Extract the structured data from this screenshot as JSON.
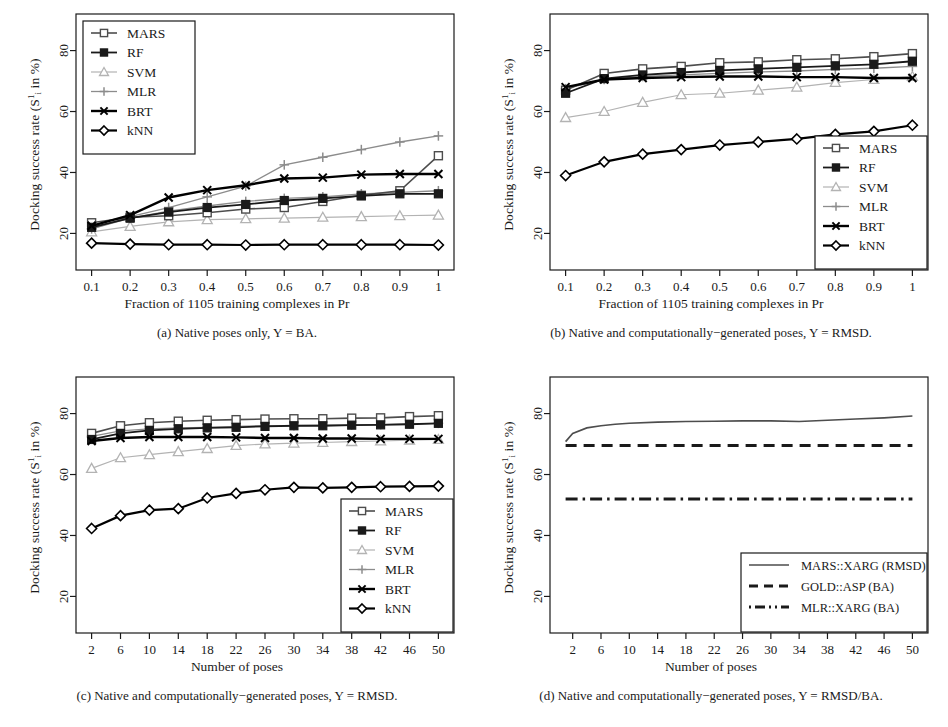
{
  "figure": {
    "y_axis_label_prefix": "Docking success rate (S",
    "y_axis_label_sub": "i",
    "y_axis_label_sup": "1",
    "y_axis_label_suffix": " in %)",
    "y_ticks": [
      20,
      40,
      60,
      80
    ],
    "y_lim": [
      8,
      92
    ]
  },
  "panels": [
    {
      "id": "a",
      "caption": "(a) Native poses only, Y = BA.",
      "xlabel": "Fraction of 1105 training complexes in Pr",
      "legend_position": "top-left"
    },
    {
      "id": "b",
      "caption": "(b) Native and computationally−generated poses, Y = RMSD.",
      "xlabel": "Fraction of 1105 training complexes in Pr",
      "legend_position": "bottom-right"
    },
    {
      "id": "c",
      "caption": "(c) Native and computationally−generated poses, Y = RMSD.",
      "xlabel": "Number of poses",
      "legend_position": "bottom-right"
    },
    {
      "id": "d",
      "caption": "(d) Native and computationally−generated poses, Y = RMSD/BA.",
      "xlabel": "Number of poses",
      "legend_position": "bottom-right"
    }
  ],
  "colors": {
    "MARS": "#4d4d4d",
    "RF": "#1a1a1a",
    "SVM": "#b3b3b3",
    "MLR": "#8c8c8c",
    "BRT": "#000000",
    "kNN": "#000000",
    "MARS_XARG": "#4d4d4d",
    "GOLD_ASP": "#1a1a1a",
    "MLR_XARG": "#1a1a1a"
  },
  "markers": {
    "MARS": "open-square",
    "RF": "filled-square",
    "SVM": "open-triangle",
    "MLR": "plus",
    "BRT": "cross-x",
    "kNN": "open-diamond"
  },
  "chart_data": [
    {
      "panel": "a",
      "type": "line",
      "title": "(a) Native poses only, Y = BA.",
      "xlabel": "Fraction of 1105 training complexes in Pr",
      "ylabel": "Docking success rate (S_i^1 in %)",
      "x": [
        0.1,
        0.2,
        0.3,
        0.4,
        0.5,
        0.6,
        0.7,
        0.8,
        0.9,
        1
      ],
      "xtick_labels": [
        "0.1",
        "0.2",
        "0.3",
        "0.4",
        "0.5",
        "0.6",
        "0.7",
        "0.8",
        "0.9",
        "1"
      ],
      "ylim": [
        8,
        92
      ],
      "ytick_labels": [
        "20",
        "40",
        "60",
        "80"
      ],
      "grid": false,
      "legend": [
        "MARS",
        "RF",
        "SVM",
        "MLR",
        "BRT",
        "kNN"
      ],
      "legend_position": "top-left",
      "series": [
        {
          "name": "MARS",
          "values": [
            23.5,
            25.3,
            25.8,
            26.8,
            28.0,
            28.5,
            30.5,
            32.5,
            34.0,
            45.5
          ]
        },
        {
          "name": "RF",
          "values": [
            22.0,
            25.0,
            27.0,
            28.5,
            29.5,
            30.8,
            31.5,
            32.3,
            33.0,
            33.0
          ]
        },
        {
          "name": "SVM",
          "values": [
            20.5,
            22.3,
            23.8,
            24.5,
            24.8,
            25.0,
            25.3,
            25.5,
            25.8,
            26.0
          ]
        },
        {
          "name": "MLR",
          "values": [
            21.5,
            25.0,
            27.3,
            29.0,
            30.5,
            31.5,
            32.0,
            33.0,
            33.5,
            34.0
          ]
        },
        {
          "name": "BRT",
          "values": [
            22.5,
            26.0,
            31.8,
            34.2,
            35.8,
            38.0,
            38.3,
            39.3,
            39.5,
            39.5
          ]
        },
        {
          "name": "kNN",
          "values": [
            16.8,
            16.5,
            16.3,
            16.3,
            16.2,
            16.3,
            16.3,
            16.3,
            16.3,
            16.2
          ]
        }
      ],
      "extra_series": [
        {
          "name": "MLR-upper",
          "values": [
            21.5,
            25.5,
            28.5,
            32.0,
            35.5,
            42.5,
            45.0,
            47.5,
            50.0,
            52.0
          ]
        }
      ]
    },
    {
      "panel": "b",
      "type": "line",
      "title": "(b) Native and computationally−generated poses, Y = RMSD.",
      "xlabel": "Fraction of 1105 training complexes in Pr",
      "ylabel": "Docking success rate (S_i^1 in %)",
      "x": [
        0.1,
        0.2,
        0.3,
        0.4,
        0.5,
        0.6,
        0.7,
        0.8,
        0.9,
        1
      ],
      "xtick_labels": [
        "0.1",
        "0.2",
        "0.3",
        "0.4",
        "0.5",
        "0.6",
        "0.7",
        "0.8",
        "0.9",
        "1"
      ],
      "ylim": [
        8,
        92
      ],
      "ytick_labels": [
        "20",
        "40",
        "60",
        "80"
      ],
      "grid": false,
      "legend": [
        "MARS",
        "RF",
        "SVM",
        "MLR",
        "BRT",
        "kNN"
      ],
      "legend_position": "bottom-right",
      "series": [
        {
          "name": "MARS",
          "values": [
            67.0,
            72.5,
            74.0,
            74.8,
            76.0,
            76.3,
            77.0,
            77.3,
            78.0,
            79.0
          ]
        },
        {
          "name": "RF",
          "values": [
            66.0,
            70.8,
            72.0,
            72.8,
            73.5,
            74.0,
            74.5,
            75.0,
            75.5,
            76.5
          ]
        },
        {
          "name": "SVM",
          "values": [
            58.0,
            60.0,
            63.0,
            65.5,
            66.0,
            67.0,
            68.0,
            69.5,
            70.5,
            71.5
          ]
        },
        {
          "name": "MLR",
          "values": [
            67.5,
            70.5,
            71.5,
            72.0,
            72.5,
            73.0,
            73.3,
            73.8,
            74.2,
            74.8
          ]
        },
        {
          "name": "BRT",
          "values": [
            68.0,
            70.5,
            71.0,
            71.3,
            71.5,
            71.5,
            71.3,
            71.3,
            71.0,
            71.0
          ]
        },
        {
          "name": "kNN",
          "values": [
            39.0,
            43.5,
            46.0,
            47.5,
            49.0,
            50.0,
            51.0,
            52.5,
            53.5,
            55.5
          ]
        }
      ]
    },
    {
      "panel": "c",
      "type": "line",
      "title": "(c) Native and computationally−generated poses, Y = RMSD.",
      "xlabel": "Number of poses",
      "ylabel": "Docking success rate (S_i^1 in %)",
      "x": [
        2,
        6,
        10,
        14,
        18,
        22,
        26,
        30,
        34,
        38,
        42,
        46,
        50
      ],
      "xtick_labels": [
        "2",
        "6",
        "10",
        "14",
        "18",
        "22",
        "26",
        "30",
        "34",
        "38",
        "42",
        "46",
        "50"
      ],
      "ylim": [
        8,
        92
      ],
      "ytick_labels": [
        "20",
        "40",
        "60",
        "80"
      ],
      "grid": false,
      "legend": [
        "MARS",
        "RF",
        "SVM",
        "MLR",
        "BRT",
        "kNN"
      ],
      "legend_position": "bottom-right",
      "series": [
        {
          "name": "MARS",
          "values": [
            73.5,
            76.0,
            77.0,
            77.5,
            77.8,
            78.0,
            78.2,
            78.3,
            78.3,
            78.5,
            78.6,
            79.0,
            79.3
          ]
        },
        {
          "name": "RF",
          "values": [
            71.5,
            73.5,
            74.5,
            75.0,
            75.3,
            75.5,
            75.8,
            76.0,
            76.0,
            76.2,
            76.3,
            76.5,
            76.8
          ]
        },
        {
          "name": "SVM",
          "values": [
            62.0,
            65.5,
            66.5,
            67.5,
            68.5,
            69.5,
            70.0,
            70.3,
            70.5,
            70.8,
            71.0,
            71.3,
            71.5
          ]
        },
        {
          "name": "MLR",
          "values": [
            72.5,
            74.3,
            75.0,
            75.3,
            75.5,
            75.8,
            76.0,
            76.0,
            76.2,
            76.3,
            76.4,
            76.6,
            76.8
          ]
        },
        {
          "name": "BRT",
          "values": [
            71.0,
            72.0,
            72.3,
            72.3,
            72.3,
            72.2,
            72.0,
            72.0,
            71.8,
            71.8,
            71.7,
            71.7,
            71.7
          ]
        },
        {
          "name": "kNN",
          "values": [
            42.3,
            46.5,
            48.3,
            48.8,
            52.3,
            53.8,
            55.0,
            55.8,
            55.6,
            55.8,
            56.0,
            56.1,
            56.2
          ]
        }
      ]
    },
    {
      "panel": "d",
      "type": "line",
      "title": "(d) Native and computationally−generated poses, Y = RMSD/BA.",
      "xlabel": "Number of poses",
      "ylabel": "Docking success rate (S_i^1 in %)",
      "x": [
        1,
        2,
        4,
        6,
        8,
        10,
        14,
        18,
        22,
        26,
        30,
        34,
        38,
        42,
        46,
        50
      ],
      "xtick_labels": [
        "2",
        "6",
        "10",
        "14",
        "18",
        "22",
        "26",
        "30",
        "34",
        "38",
        "42",
        "46",
        "50"
      ],
      "ylim": [
        8,
        92
      ],
      "ytick_labels": [
        "20",
        "40",
        "60",
        "80"
      ],
      "grid": false,
      "legend": [
        "MARS::XARG (RMSD)",
        "GOLD::ASP (BA)",
        "MLR::XARG (BA)"
      ],
      "legend_position": "bottom-right",
      "line_styles": [
        "solid",
        "dashed",
        "dashdot"
      ],
      "series": [
        {
          "name": "MARS::XARG (RMSD)",
          "values": [
            70.8,
            73.5,
            75.3,
            76.0,
            76.5,
            76.8,
            77.2,
            77.4,
            77.5,
            77.6,
            77.6,
            77.4,
            77.8,
            78.2,
            78.6,
            79.2
          ]
        },
        {
          "name": "GOLD::ASP (BA)",
          "values": [
            69.5,
            69.5,
            69.5,
            69.5,
            69.5,
            69.5,
            69.5,
            69.5,
            69.5,
            69.5,
            69.5,
            69.5,
            69.5,
            69.5,
            69.5,
            69.5
          ]
        },
        {
          "name": "MLR::XARG (BA)",
          "values": [
            52.0,
            52.0,
            52.0,
            52.0,
            52.0,
            52.0,
            52.0,
            52.0,
            52.0,
            52.0,
            52.0,
            52.0,
            52.0,
            52.0,
            52.0,
            52.0
          ]
        }
      ]
    }
  ]
}
